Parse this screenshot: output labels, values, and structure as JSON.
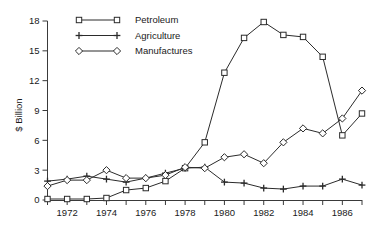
{
  "chart_data": {
    "type": "line",
    "title": "",
    "xlabel": "",
    "ylabel": "$ Billion",
    "x": [
      1971,
      1972,
      1973,
      1974,
      1975,
      1976,
      1977,
      1978,
      1979,
      1980,
      1981,
      1982,
      1983,
      1984,
      1985,
      1986,
      1987
    ],
    "xtick_labels": [
      "1972",
      "1974",
      "1976",
      "1978",
      "1980",
      "1982",
      "1984",
      "1986"
    ],
    "xtick_values": [
      1972,
      1974,
      1976,
      1978,
      1980,
      1982,
      1984,
      1986
    ],
    "ytick_labels": [
      "0",
      "3",
      "6",
      "9",
      "12",
      "15",
      "18"
    ],
    "ytick_values": [
      0,
      3,
      6,
      9,
      12,
      15,
      18
    ],
    "ylim": [
      0,
      18
    ],
    "xlim": [
      1971,
      1987
    ],
    "grid": false,
    "legend_position": "top-left",
    "series": [
      {
        "name": "Petroleum",
        "marker": "square",
        "values": [
          0.1,
          0.1,
          0.1,
          0.2,
          1.0,
          1.2,
          1.9,
          3.2,
          5.8,
          12.8,
          16.3,
          17.9,
          16.6,
          16.4,
          14.4,
          6.5,
          8.7
        ]
      },
      {
        "name": "Agriculture",
        "marker": "plus",
        "values": [
          1.9,
          2.1,
          2.4,
          2.1,
          1.8,
          2.2,
          2.7,
          3.2,
          3.3,
          1.8,
          1.7,
          1.2,
          1.1,
          1.4,
          1.4,
          2.1,
          1.5
        ]
      },
      {
        "name": "Manufactures",
        "marker": "diamond",
        "values": [
          1.4,
          2.0,
          2.0,
          3.0,
          2.2,
          2.2,
          2.5,
          3.3,
          3.2,
          4.3,
          4.6,
          3.7,
          5.8,
          7.2,
          6.7,
          8.2,
          11.0
        ]
      }
    ]
  },
  "legend": {
    "items": [
      {
        "label": "Petroleum",
        "marker": "square"
      },
      {
        "label": "Agriculture",
        "marker": "plus"
      },
      {
        "label": "Manufactures",
        "marker": "diamond"
      }
    ]
  },
  "axes": {
    "y_title": "$ Billion"
  }
}
